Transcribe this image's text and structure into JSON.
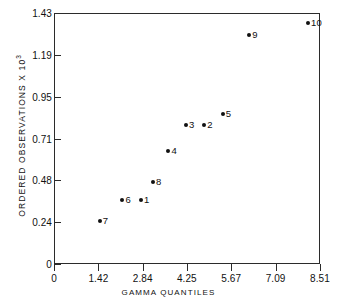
{
  "chart_data": {
    "type": "scatter",
    "title": "",
    "xlabel": "GAMMA QUANTILES",
    "ylabel": "ORDERED OBSERVATIONS  X 10",
    "ylabel_exponent": "3",
    "xlim": [
      0,
      8.51
    ],
    "ylim": [
      0,
      1.43
    ],
    "xticks": [
      0,
      1.42,
      2.84,
      4.25,
      5.67,
      7.09,
      8.51
    ],
    "xticklabels": [
      "0",
      "1.42",
      "2.84",
      "4.25",
      "5.67",
      "7.09",
      "8.51"
    ],
    "yticks": [
      0,
      0.24,
      0.48,
      0.71,
      0.95,
      1.19,
      1.43
    ],
    "yticklabels": [
      "0",
      "0.24",
      "0.48",
      "0.71",
      "0.95",
      "1.19",
      "1.43"
    ],
    "grid": false,
    "legend": "none",
    "marker": "filled-circle",
    "marker_color": "#111111",
    "points": [
      {
        "label": "7",
        "x": 1.46,
        "y": 0.245
      },
      {
        "label": "6",
        "x": 2.19,
        "y": 0.365
      },
      {
        "label": "1",
        "x": 2.78,
        "y": 0.365
      },
      {
        "label": "8",
        "x": 3.17,
        "y": 0.47
      },
      {
        "label": "4",
        "x": 3.66,
        "y": 0.645
      },
      {
        "label": "3",
        "x": 4.22,
        "y": 0.79
      },
      {
        "label": "2",
        "x": 4.81,
        "y": 0.79
      },
      {
        "label": "5",
        "x": 5.4,
        "y": 0.855
      },
      {
        "label": "9",
        "x": 6.25,
        "y": 1.305
      },
      {
        "label": "10",
        "x": 8.13,
        "y": 1.375
      }
    ]
  }
}
